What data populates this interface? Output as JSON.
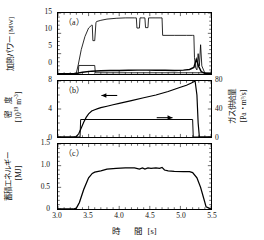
{
  "figure": {
    "panel_tags": {
      "a": "（a）",
      "b": "（b）",
      "c": "（c）"
    },
    "xaxis": {
      "title_main": "時　間",
      "title_unit": "[s]",
      "ticks": [
        "3.0",
        "3.5",
        "4.0",
        "4.5",
        "5.0",
        "5.5"
      ]
    },
    "panel_a": {
      "ylabel_main": "加熱パワー",
      "ylabel_unit": "[MW]",
      "ticks": [
        "0",
        "5",
        "10",
        "15"
      ]
    },
    "panel_b": {
      "ylabel_main": "密　度",
      "ylabel_unit_base": "[10",
      "ylabel_unit_exp1": "19",
      "ylabel_unit_mid": " m",
      "ylabel_unit_exp2": "-3",
      "ylabel_unit_end": "]",
      "ticks": [
        "0",
        "4",
        "8"
      ],
      "right_ylabel_main": "ガス供給量",
      "right_ylabel_unit": "[Pa・m³/s]",
      "right_ticks": [
        "0",
        "40",
        "80"
      ],
      "arrow_left": "←",
      "arrow_right": "→"
    },
    "panel_c": {
      "ylabel_main": "蓄積エネルギー",
      "ylabel_unit": "[MJ]",
      "ticks": [
        "0",
        "0.5",
        "1.0",
        "1.5"
      ]
    }
  },
  "chart_data": [
    {
      "type": "line",
      "title": "(a) Heating power",
      "xlabel": "Time [s]",
      "ylabel": "Heating power [MW]",
      "xlim": [
        3.0,
        5.5
      ],
      "ylim": [
        0,
        15
      ],
      "grid": false,
      "legend": "none",
      "series": [
        {
          "name": "NBI heating power",
          "x": [
            3.0,
            3.25,
            3.3,
            3.33,
            3.38,
            3.44,
            3.5,
            3.55,
            3.56,
            3.57,
            3.6,
            3.62,
            3.63,
            3.7,
            3.8,
            3.95,
            4.1,
            4.25,
            4.28,
            4.29,
            4.33,
            4.34,
            4.38,
            4.42,
            4.43,
            4.47,
            4.48,
            4.52,
            4.6,
            4.68,
            4.7,
            4.71,
            4.9,
            5.1,
            5.2,
            5.22,
            5.23,
            5.25,
            5.27,
            5.29,
            5.31,
            5.33,
            5.35,
            5.4,
            5.5
          ],
          "y": [
            0.1,
            0.1,
            0.3,
            2.2,
            6.0,
            9.2,
            11.3,
            12.0,
            12.0,
            8.2,
            8.2,
            12.6,
            12.9,
            13.2,
            13.5,
            13.7,
            13.8,
            13.8,
            13.8,
            11.3,
            11.3,
            13.8,
            13.8,
            13.8,
            11.4,
            11.4,
            13.8,
            13.8,
            13.8,
            13.8,
            13.8,
            9.5,
            9.5,
            9.5,
            9.5,
            9.5,
            4.0,
            1.5,
            1.0,
            5.0,
            2.0,
            7.2,
            2.0,
            0.2,
            0.1
          ]
        },
        {
          "name": "ECH / auxiliary step",
          "x": [
            3.0,
            3.33,
            3.34,
            3.6,
            3.61,
            5.5
          ],
          "y": [
            0.05,
            0.05,
            2.1,
            2.1,
            0.3,
            0.3
          ]
        },
        {
          "name": "Radiated / low-level noisy trace",
          "x": [
            3.0,
            3.2,
            3.3,
            3.4,
            3.55,
            3.7,
            3.85,
            4.0,
            4.15,
            4.3,
            4.45,
            4.6,
            4.75,
            4.9,
            5.05,
            5.15,
            5.22,
            5.26,
            5.3,
            5.34,
            5.4,
            5.5
          ],
          "y": [
            0.08,
            0.08,
            0.15,
            0.45,
            0.7,
            0.8,
            0.85,
            0.88,
            0.9,
            0.95,
            0.95,
            0.92,
            0.9,
            0.88,
            0.95,
            1.1,
            1.6,
            3.6,
            1.8,
            0.6,
            0.15,
            0.08
          ]
        }
      ]
    },
    {
      "type": "line",
      "title": "(b) Line-averaged density and gas fueling",
      "xlabel": "Time [s]",
      "ylabel_left": "Density [10^19 m^-3]",
      "ylabel_right": "Gas supply [Pa m^3/s]",
      "xlim": [
        3.0,
        5.5
      ],
      "ylim_left": [
        0,
        8
      ],
      "ylim_right": [
        0,
        80
      ],
      "grid": false,
      "legend": "arrows",
      "series": [
        {
          "name": "Density (left axis)",
          "axis": "left",
          "x": [
            3.0,
            3.25,
            3.3,
            3.34,
            3.38,
            3.42,
            3.46,
            3.5,
            3.55,
            3.6,
            3.65,
            3.7,
            3.8,
            3.9,
            4.0,
            4.2,
            4.4,
            4.6,
            4.8,
            5.0,
            5.1,
            5.18,
            5.24,
            5.27,
            5.29,
            5.31,
            5.5
          ],
          "y": [
            0.0,
            0.0,
            0.05,
            0.5,
            1.3,
            2.1,
            2.8,
            3.3,
            3.7,
            3.9,
            4.05,
            4.2,
            4.4,
            4.6,
            4.8,
            5.2,
            5.6,
            6.0,
            6.5,
            7.1,
            7.4,
            7.7,
            8.0,
            6.0,
            2.0,
            0.0,
            0.0
          ]
        },
        {
          "name": "Gas supply (right axis)",
          "axis": "right",
          "x": [
            3.0,
            3.36,
            3.37,
            5.2,
            5.21,
            5.5
          ],
          "y": [
            0.0,
            0.0,
            25.0,
            25.0,
            0.0,
            0.0
          ]
        }
      ]
    },
    {
      "type": "line",
      "title": "(c) Stored energy",
      "xlabel": "Time [s]",
      "ylabel": "Stored energy [MJ]",
      "xlim": [
        3.0,
        5.5
      ],
      "ylim": [
        0,
        1.5
      ],
      "grid": false,
      "legend": "none",
      "series": [
        {
          "name": "Stored energy",
          "x": [
            3.0,
            3.25,
            3.3,
            3.35,
            3.42,
            3.5,
            3.56,
            3.6,
            3.7,
            3.8,
            3.95,
            4.1,
            4.25,
            4.33,
            4.38,
            4.42,
            4.47,
            4.52,
            4.6,
            4.66,
            4.7,
            4.74,
            4.8,
            4.9,
            5.05,
            5.15,
            5.2,
            5.27,
            5.33,
            5.38,
            5.42,
            5.5
          ],
          "y": [
            0.0,
            0.0,
            0.02,
            0.15,
            0.45,
            0.72,
            0.82,
            0.85,
            0.88,
            0.92,
            0.94,
            0.95,
            0.95,
            0.92,
            0.95,
            0.92,
            0.95,
            0.94,
            0.95,
            0.94,
            0.96,
            0.9,
            0.88,
            0.87,
            0.86,
            0.86,
            0.84,
            0.72,
            0.5,
            0.25,
            0.05,
            0.0
          ]
        }
      ]
    }
  ]
}
